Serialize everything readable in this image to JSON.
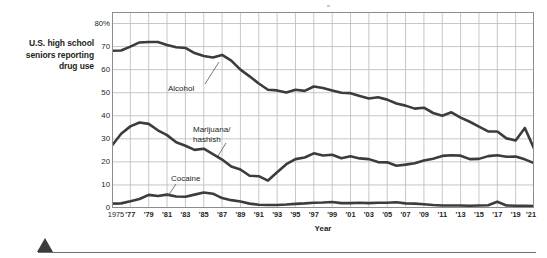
{
  "figure": {
    "y_axis_title": "U.S. high school\nseniors reporting\ndrug use",
    "x_axis_title": "Year",
    "footer_marker": "triangle-marker"
  },
  "chart_data": {
    "type": "line",
    "title": "",
    "xlabel": "Year",
    "ylabel": "U.S. high school seniors reporting drug use",
    "ylim": [
      0,
      85
    ],
    "xlim": [
      1975,
      2021
    ],
    "grid": true,
    "legend_position": "inline-annotations",
    "y_ticks": [
      "0",
      "10",
      "20",
      "30",
      "40",
      "50",
      "60",
      "70",
      "80%"
    ],
    "y_tick_values": [
      0,
      10,
      20,
      30,
      40,
      50,
      60,
      70,
      80
    ],
    "x_tick_labels": [
      "1975",
      "'77",
      "'79",
      "'81",
      "'83",
      "'85",
      "'87",
      "'89",
      "'91",
      "'93",
      "'95",
      "'97",
      "'99",
      "'01",
      "'03",
      "'05",
      "'07",
      "'09",
      "'11",
      "'13",
      "'15",
      "'17",
      "'19",
      "'21"
    ],
    "x_tick_values": [
      1975,
      1977,
      1979,
      1981,
      1983,
      1985,
      1987,
      1989,
      1991,
      1993,
      1995,
      1997,
      1999,
      2001,
      2003,
      2005,
      2007,
      2009,
      2011,
      2013,
      2015,
      2017,
      2019,
      2021
    ],
    "x": [
      1975,
      1976,
      1977,
      1978,
      1979,
      1980,
      1981,
      1982,
      1983,
      1984,
      1985,
      1986,
      1987,
      1988,
      1989,
      1990,
      1991,
      1992,
      1993,
      1994,
      1995,
      1996,
      1997,
      1998,
      1999,
      2000,
      2001,
      2002,
      2003,
      2004,
      2005,
      2006,
      2007,
      2008,
      2009,
      2010,
      2011,
      2012,
      2013,
      2014,
      2015,
      2016,
      2017,
      2018,
      2019,
      2020,
      2021
    ],
    "series": [
      {
        "name": "Alcohol",
        "color": "#3c3c3c",
        "values": [
          68.2,
          68.3,
          70.0,
          71.8,
          72.0,
          72.0,
          70.7,
          69.7,
          69.4,
          67.2,
          65.9,
          65.3,
          66.4,
          63.9,
          60.0,
          57.1,
          54.0,
          51.3,
          51.0,
          50.1,
          51.3,
          50.8,
          52.7,
          52.0,
          51.0,
          50.0,
          49.8,
          48.6,
          47.5,
          48.0,
          47.0,
          45.3,
          44.4,
          43.1,
          43.5,
          41.2,
          40.0,
          41.5,
          39.2,
          37.4,
          35.3,
          33.2,
          33.2,
          30.2,
          29.3,
          34.7,
          25.8
        ],
        "label_annotation": "Alcohol"
      },
      {
        "name": "Marijuana/hashish",
        "color": "#3c3c3c",
        "values": [
          27.1,
          32.2,
          35.4,
          37.1,
          36.5,
          33.7,
          31.6,
          28.5,
          27.0,
          25.2,
          25.7,
          23.4,
          21.0,
          18.0,
          16.7,
          14.0,
          13.8,
          11.9,
          15.5,
          19.0,
          21.2,
          21.9,
          23.7,
          22.8,
          23.1,
          21.6,
          22.4,
          21.5,
          21.2,
          19.9,
          19.8,
          18.3,
          18.8,
          19.4,
          20.6,
          21.4,
          22.6,
          22.9,
          22.7,
          21.2,
          21.3,
          22.5,
          22.9,
          22.2,
          22.3,
          21.1,
          19.5
        ],
        "label_annotation": "Marijuana/\nhashish"
      },
      {
        "name": "Cocaine",
        "color": "#3c3c3c",
        "values": [
          1.9,
          2.0,
          2.9,
          3.9,
          5.7,
          5.2,
          5.8,
          5.0,
          4.9,
          5.8,
          6.7,
          6.2,
          4.3,
          3.4,
          2.8,
          1.9,
          1.4,
          1.3,
          1.3,
          1.5,
          1.8,
          2.0,
          2.3,
          2.4,
          2.6,
          2.1,
          2.1,
          2.3,
          2.1,
          2.3,
          2.3,
          2.5,
          2.0,
          1.9,
          1.6,
          1.3,
          1.1,
          1.1,
          1.1,
          1.0,
          1.1,
          1.2,
          2.7,
          1.1,
          1.0,
          0.9,
          0.8
        ],
        "label_annotation": "Cocaine"
      }
    ]
  }
}
